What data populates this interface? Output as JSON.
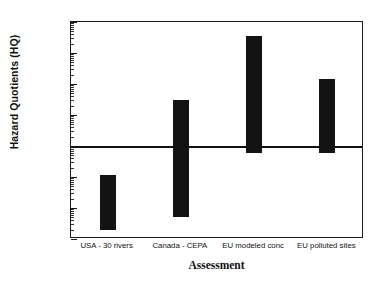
{
  "chart_data": {
    "type": "bar",
    "title": "",
    "subtitle": "",
    "xlabel": "Assessment",
    "ylabel": "Hazard Quotients (HQ)",
    "yscale": "log",
    "ylim": [
      0.001,
      10000
    ],
    "grid": false,
    "legend": null,
    "categories": [
      "USA - 30 rivers",
      "Canada - CEPA",
      "EU modeled conc",
      "EU polluted sites"
    ],
    "bar_style": "floating-range",
    "ranges": [
      {
        "category": "USA - 30 rivers",
        "low": 0.002,
        "high": 0.12
      },
      {
        "category": "Canada - CEPA",
        "low": 0.005,
        "high": 30
      },
      {
        "category": "EU modeled conc",
        "low": 0.6,
        "high": 3500
      },
      {
        "category": "EU polluted sites",
        "low": 0.6,
        "high": 140
      }
    ],
    "ytick_labels": [
      "10,000",
      "1000",
      "100",
      "10",
      "1",
      "0.1",
      "0.01",
      "0.001"
    ],
    "ytick_values": [
      10000,
      1000,
      100,
      10,
      1,
      0.1,
      0.01,
      0.001
    ],
    "annotations": [
      {
        "name": "hq-threshold",
        "value": 1,
        "orientation": "horizontal",
        "label": ""
      }
    ],
    "colors": {
      "bar": "#131313",
      "axis": "#1a1a1a",
      "threshold": "#111111",
      "background": "#ffffff",
      "text": "#111111"
    }
  }
}
